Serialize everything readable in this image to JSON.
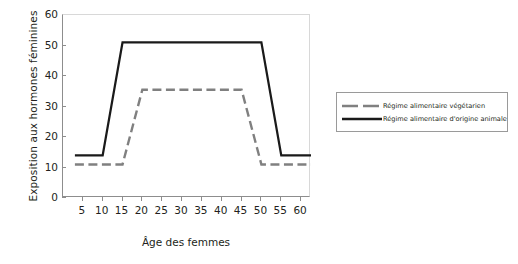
{
  "chart_data": {
    "type": "line",
    "title": "",
    "xlabel": "Âge des femmes",
    "ylabel": "Exposition aux hormones féminines",
    "xlim": [
      0,
      62.5
    ],
    "ylim": [
      0,
      60
    ],
    "xticks": [
      5,
      10,
      15,
      20,
      25,
      30,
      35,
      40,
      45,
      50,
      55,
      60
    ],
    "yticks": [
      0,
      10,
      20,
      30,
      40,
      50,
      60
    ],
    "grid": false,
    "legend_position": "right",
    "series": [
      {
        "name": "Régime alimentaire végétarien",
        "color": "#808080",
        "style": "dashed",
        "x": [
          3,
          15,
          20,
          45,
          50,
          62.5
        ],
        "y": [
          11,
          11,
          35.5,
          35.5,
          11,
          11
        ]
      },
      {
        "name": "Régime alimentaire d'origine animale",
        "color": "#1a1a1a",
        "style": "solid",
        "x": [
          3,
          10,
          15,
          50,
          55,
          62.5
        ],
        "y": [
          14,
          14,
          51,
          51,
          14,
          14
        ]
      }
    ]
  },
  "axes": {
    "ylabel": "Exposition aux hormones féminines",
    "xlabel": "Âge des femmes",
    "yticks": [
      "0",
      "10",
      "20",
      "30",
      "40",
      "50",
      "60"
    ],
    "xticks": [
      "5",
      "10",
      "15",
      "20",
      "25",
      "30",
      "35",
      "40",
      "45",
      "50",
      "55",
      "60"
    ]
  },
  "legend": {
    "items": [
      {
        "label": "Régime alimentaire végétarien",
        "color": "#808080",
        "style": "dashed"
      },
      {
        "label": "Régime alimentaire d'origine animale",
        "color": "#1a1a1a",
        "style": "solid"
      }
    ]
  }
}
